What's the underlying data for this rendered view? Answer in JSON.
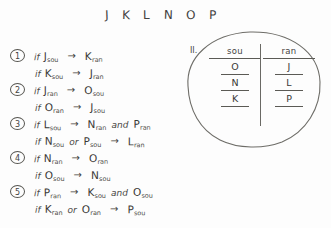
{
  "page": {
    "background_color": "#fdfdfd",
    "ink_color": "#3b3a37"
  },
  "letter_row": {
    "name": "entity-letters",
    "letters": [
      "J",
      "K",
      "L",
      "N",
      "O",
      "P"
    ]
  },
  "rules": {
    "arrow_glyph": "→",
    "if_label": "if",
    "and_label": "and",
    "or_label": "or",
    "lines": [
      {
        "badge": "1",
        "antecedent": [
          {
            "letter": "J",
            "sub": "sou"
          }
        ],
        "antecedent_conj": "",
        "consequent": [
          {
            "letter": "K",
            "sub": "ran"
          }
        ],
        "consequent_conj": ""
      },
      {
        "badge": "",
        "antecedent": [
          {
            "letter": "K",
            "sub": "sou"
          }
        ],
        "antecedent_conj": "",
        "consequent": [
          {
            "letter": "J",
            "sub": "ran"
          }
        ],
        "consequent_conj": ""
      },
      {
        "badge": "2",
        "antecedent": [
          {
            "letter": "J",
            "sub": "ran"
          }
        ],
        "antecedent_conj": "",
        "consequent": [
          {
            "letter": "O",
            "sub": "sou"
          }
        ],
        "consequent_conj": ""
      },
      {
        "badge": "",
        "antecedent": [
          {
            "letter": "O",
            "sub": "ran"
          }
        ],
        "antecedent_conj": "",
        "consequent": [
          {
            "letter": "J",
            "sub": "sou"
          }
        ],
        "consequent_conj": ""
      },
      {
        "badge": "3",
        "antecedent": [
          {
            "letter": "L",
            "sub": "sou"
          }
        ],
        "antecedent_conj": "",
        "consequent": [
          {
            "letter": "N",
            "sub": "ran"
          },
          {
            "letter": "P",
            "sub": "ran"
          }
        ],
        "consequent_conj": "and"
      },
      {
        "badge": "",
        "antecedent": [
          {
            "letter": "N",
            "sub": "sou"
          },
          {
            "letter": "P",
            "sub": "sou"
          }
        ],
        "antecedent_conj": "or",
        "consequent": [
          {
            "letter": "L",
            "sub": "ran"
          }
        ],
        "consequent_conj": ""
      },
      {
        "badge": "4",
        "antecedent": [
          {
            "letter": "N",
            "sub": "ran"
          }
        ],
        "antecedent_conj": "",
        "consequent": [
          {
            "letter": "O",
            "sub": "ran"
          }
        ],
        "consequent_conj": ""
      },
      {
        "badge": "",
        "antecedent": [
          {
            "letter": "O",
            "sub": "sou"
          }
        ],
        "antecedent_conj": "",
        "consequent": [
          {
            "letter": "N",
            "sub": "sou"
          }
        ],
        "consequent_conj": ""
      },
      {
        "badge": "5",
        "antecedent": [
          {
            "letter": "P",
            "sub": "ran"
          }
        ],
        "antecedent_conj": "",
        "consequent": [
          {
            "letter": "K",
            "sub": "sou"
          },
          {
            "letter": "O",
            "sub": "sou"
          }
        ],
        "consequent_conj": "and"
      },
      {
        "badge": "",
        "antecedent": [
          {
            "letter": "K",
            "sub": "ran"
          },
          {
            "letter": "O",
            "sub": "ran"
          }
        ],
        "antecedent_conj": "or",
        "consequent": [
          {
            "letter": "P",
            "sub": "sou"
          }
        ],
        "consequent_conj": ""
      }
    ]
  },
  "diagram": {
    "label": "II.",
    "columns": [
      "sou",
      "ran"
    ],
    "rows": [
      [
        "O",
        "J"
      ],
      [
        "N",
        "L"
      ],
      [
        "K",
        "P"
      ]
    ]
  }
}
